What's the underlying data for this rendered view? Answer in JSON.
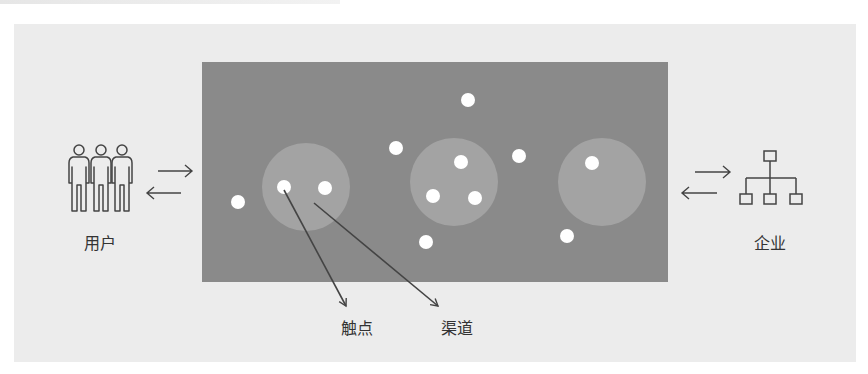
{
  "labels": {
    "users": "用户",
    "enterprise": "企业",
    "touchpoint": "触点",
    "channel": "渠道"
  },
  "colors": {
    "outer_background": "#ececec",
    "panel": "#8a8a8a",
    "cluster_circle": "#a3a3a3",
    "dot": "#ffffff",
    "stroke": "#444444",
    "text": "#333333"
  },
  "icons": {
    "users": "three-people-icon",
    "enterprise": "org-chart-icon",
    "exchange_left": "bidirectional-arrows-icon",
    "exchange_right": "bidirectional-arrows-icon"
  }
}
